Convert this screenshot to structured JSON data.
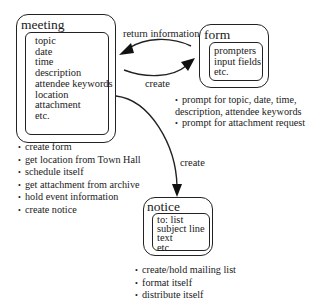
{
  "diagram": {
    "meeting": {
      "title": "meeting",
      "attributes": [
        "topic",
        "date",
        "time",
        "description",
        "attendee keywords",
        "location",
        "attachment",
        "etc."
      ],
      "responsibilities": [
        "create form",
        "get location from Town Hall",
        "schedule itself",
        "get attachment from archive",
        "hold event information",
        "create notice"
      ]
    },
    "form": {
      "title": "form",
      "attributes": [
        "prompters",
        "input fields",
        "etc."
      ],
      "responsibilities": [
        "prompt for topic, date, time,",
        "description, attendee keywords",
        "prompt for attachment request"
      ]
    },
    "notice": {
      "title": "notice",
      "attributes": [
        "to: list",
        "subject line",
        "text",
        "etc."
      ],
      "responsibilities": [
        "create/hold mailing list",
        "format itself",
        "distribute itself"
      ]
    },
    "arrows": {
      "form_to_meeting": "return information",
      "meeting_to_form": "create",
      "meeting_to_notice": "create"
    }
  }
}
